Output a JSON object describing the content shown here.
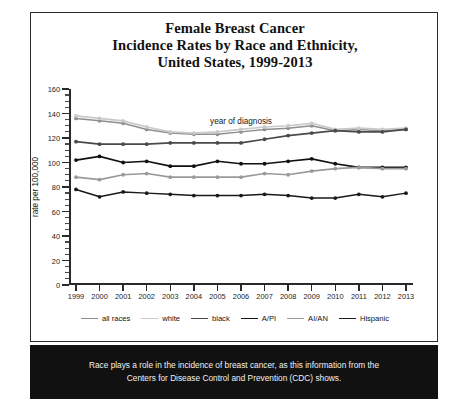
{
  "top_strip": {
    "cut_text": ""
  },
  "panel": {
    "title_lines": [
      "Female Breast Cancer",
      "Incidence Rates by Race and Ethnicity,",
      "United States, 1999-2013"
    ]
  },
  "caption": {
    "line1": "Race plays a role in the incidence of breast cancer, as this information from the",
    "line2": "Centers for Disease Control and Prevention (CDC) shows."
  },
  "colors": {
    "all_races": "#8e8e8e",
    "white": "#c9c9c9",
    "black": "#4a4a4a",
    "a_pi": "#111111",
    "ai_an": "#9a9a9a",
    "hispanic": "#1a1a1a",
    "axis": "#2a2a2a",
    "frame": "#2b2b2b",
    "caption_bg": "#111111"
  },
  "chart_data": {
    "type": "line",
    "title": "Female Breast Cancer Incidence Rates by Race and Ethnicity, United States, 1999-2013",
    "xlabel": "year of diagnosis",
    "ylabel": "rate per 100,000",
    "categories": [
      1999,
      2000,
      2001,
      2002,
      2003,
      2004,
      2005,
      2006,
      2007,
      2008,
      2009,
      2010,
      2011,
      2012,
      2013
    ],
    "x_tick_labels": [
      "1999",
      "2000",
      "2001",
      "2002",
      "2003",
      "2004",
      "2005",
      "2006",
      "2007",
      "2008",
      "2009",
      "2010",
      "2011",
      "2012",
      "2013"
    ],
    "y_tick_labels": [
      "0",
      "20",
      "40",
      "60",
      "80",
      "100",
      "120",
      "140",
      "160"
    ],
    "ylim": [
      0,
      160
    ],
    "y_major_step": 20,
    "y_minor_step": 5,
    "grid": false,
    "legend_position": "bottom",
    "series": [
      {
        "name": "all races",
        "color": "#8e8e8e",
        "width": 1.5,
        "values": [
          136,
          134,
          132,
          127,
          124,
          123,
          123,
          125,
          127,
          128,
          130,
          126,
          127,
          126,
          127
        ]
      },
      {
        "name": "white",
        "color": "#c9c9c9",
        "width": 1.7,
        "values": [
          138,
          136,
          134,
          129,
          125,
          124,
          125,
          127,
          129,
          130,
          132,
          127,
          128,
          127,
          128
        ]
      },
      {
        "name": "black",
        "color": "#4a4a4a",
        "width": 1.7,
        "values": [
          117,
          115,
          115,
          115,
          116,
          116,
          116,
          116,
          119,
          122,
          124,
          126,
          125,
          125,
          127
        ]
      },
      {
        "name": "A/PI",
        "color": "#111111",
        "width": 1.7,
        "values": [
          102,
          105,
          100,
          101,
          97,
          97,
          101,
          99,
          99,
          101,
          103,
          99,
          96,
          96,
          96
        ]
      },
      {
        "name": "AI/AN",
        "color": "#9a9a9a",
        "width": 1.7,
        "values": [
          88,
          86,
          90,
          91,
          88,
          88,
          88,
          88,
          91,
          90,
          93,
          95,
          96,
          95,
          95
        ]
      },
      {
        "name": "Hispanic",
        "color": "#1a1a1a",
        "width": 1.5,
        "values": [
          78,
          72,
          76,
          75,
          74,
          73,
          73,
          73,
          74,
          73,
          71,
          71,
          74,
          72,
          75
        ]
      }
    ],
    "legend_entries": [
      "all races",
      "white",
      "black",
      "A/PI",
      "AI/AN",
      "Hispanic"
    ]
  }
}
